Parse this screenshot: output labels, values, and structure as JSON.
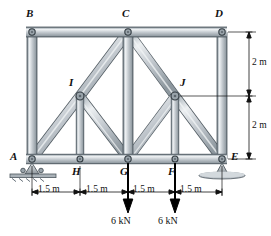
{
  "figure": {
    "kind": "truss-free-body-diagram",
    "background": "#ffffff",
    "member_fill": "#c3c9cd",
    "member_edge": "#5a656d",
    "member_highlight": "#e8ecef",
    "joint_fill": "#9aa4ab",
    "joint_edge": "#3e474d",
    "support_fill": "#b9c0c5",
    "dim_color": "#111111",
    "load_color": "#000000"
  },
  "joints": {
    "A": {
      "label": "A",
      "x": 32,
      "y": 159,
      "label_x": 10,
      "label_y": 152
    },
    "B": {
      "label": "B",
      "x": 32,
      "y": 32,
      "label_x": 26,
      "label_y": 8
    },
    "C": {
      "label": "C",
      "x": 128,
      "y": 32,
      "label_x": 122,
      "label_y": 8
    },
    "D": {
      "label": "D",
      "x": 222,
      "y": 32,
      "label_x": 215,
      "label_y": 8
    },
    "E": {
      "label": "E",
      "x": 222,
      "y": 159,
      "label_x": 232,
      "label_y": 152
    },
    "F": {
      "label": "F",
      "x": 175,
      "y": 159,
      "label_x": 168,
      "label_y": 166
    },
    "G": {
      "label": "G",
      "x": 128,
      "y": 159,
      "label_x": 120,
      "label_y": 166
    },
    "H": {
      "label": "H",
      "x": 80,
      "y": 159,
      "label_x": 72,
      "label_y": 166
    },
    "I": {
      "label": "I",
      "x": 80,
      "y": 96,
      "label_x": 69,
      "label_y": 78
    },
    "J": {
      "label": "J",
      "x": 175,
      "y": 96,
      "label_x": 180,
      "label_y": 78
    }
  },
  "members": [
    {
      "name": "top-chord-BC",
      "from": "B",
      "to": "C"
    },
    {
      "name": "top-chord-CD",
      "from": "C",
      "to": "D"
    },
    {
      "name": "bottom-chord-AH",
      "from": "A",
      "to": "H"
    },
    {
      "name": "bottom-chord-HG",
      "from": "H",
      "to": "G"
    },
    {
      "name": "bottom-chord-GF",
      "from": "G",
      "to": "F"
    },
    {
      "name": "bottom-chord-FE",
      "from": "F",
      "to": "E"
    },
    {
      "name": "vertical-AB",
      "from": "A",
      "to": "B"
    },
    {
      "name": "vertical-CG",
      "from": "C",
      "to": "G"
    },
    {
      "name": "vertical-DE",
      "from": "D",
      "to": "E"
    },
    {
      "name": "vertical-IH",
      "from": "I",
      "to": "H"
    },
    {
      "name": "vertical-JF",
      "from": "J",
      "to": "F"
    },
    {
      "name": "diagonal-AI",
      "from": "A",
      "to": "I"
    },
    {
      "name": "diagonal-IC",
      "from": "I",
      "to": "C"
    },
    {
      "name": "diagonal-CJ",
      "from": "C",
      "to": "J"
    },
    {
      "name": "diagonal-JE",
      "from": "J",
      "to": "E"
    },
    {
      "name": "diagonal-IG",
      "from": "I",
      "to": "G"
    },
    {
      "name": "diagonal-JG",
      "from": "J",
      "to": "G"
    }
  ],
  "supports": [
    {
      "name": "pin-support-A",
      "type": "pin",
      "at": "A"
    },
    {
      "name": "rocker-support-E",
      "type": "rocker",
      "at": "E"
    }
  ],
  "loads": [
    {
      "name": "load-at-G",
      "at": "G",
      "magnitude": "6 kN",
      "direction": "down",
      "label_x": 111,
      "label_y": 222,
      "arrow_x": 128,
      "arrow_top": 163,
      "arrow_bottom": 212
    },
    {
      "name": "load-at-F",
      "at": "F",
      "magnitude": "6 kN",
      "direction": "down",
      "label_x": 158,
      "label_y": 222,
      "arrow_x": 175,
      "arrow_top": 163,
      "arrow_bottom": 212
    }
  ],
  "dimensions": {
    "horizontal": [
      {
        "name": "dim-A-H",
        "text": "1.5 m",
        "x1": 32,
        "x2": 80,
        "y": 192,
        "label_x": 38,
        "label_y": 186
      },
      {
        "name": "dim-H-G",
        "text": "1.5 m",
        "x1": 80,
        "x2": 128,
        "y": 192,
        "label_x": 86,
        "label_y": 186
      },
      {
        "name": "dim-G-F",
        "text": "1.5 m",
        "x1": 128,
        "x2": 175,
        "y": 192,
        "label_x": 133,
        "label_y": 186
      },
      {
        "name": "dim-F-E",
        "text": "1.5 m",
        "x1": 175,
        "x2": 222,
        "y": 192,
        "label_x": 180,
        "label_y": 186
      }
    ],
    "vertical": [
      {
        "name": "dim-top-2m",
        "text": "2 m",
        "y1": 32,
        "y2": 96,
        "x": 249,
        "label_x": 252,
        "label_y": 58
      },
      {
        "name": "dim-bottom-2m",
        "text": "2 m",
        "y1": 96,
        "y2": 159,
        "x": 249,
        "label_x": 252,
        "label_y": 121
      }
    ]
  }
}
